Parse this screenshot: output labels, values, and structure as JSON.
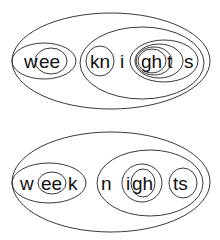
{
  "diagrams": [
    {
      "word": "weeknights",
      "segments": [
        {
          "text": "w",
          "x": 24,
          "y": 68
        },
        {
          "text": "ee",
          "x": 37,
          "y": 68
        },
        {
          "text": "kn",
          "x": 90,
          "y": 68
        },
        {
          "text": "i",
          "x": 119,
          "y": 68
        },
        {
          "text": "gh",
          "x": 142,
          "y": 68
        },
        {
          "text": "t",
          "x": 168,
          "y": 68
        },
        {
          "text": "s",
          "x": 183,
          "y": 68
        }
      ]
    },
    {
      "word": "week nights",
      "segments": [
        {
          "text": "w",
          "x": 20,
          "y": 190
        },
        {
          "text": "ee",
          "x": 39,
          "y": 190
        },
        {
          "text": "k",
          "x": 68,
          "y": 190
        },
        {
          "text": "n",
          "x": 101,
          "y": 190
        },
        {
          "text": "i",
          "x": 124,
          "y": 190
        },
        {
          "text": "gh",
          "x": 134,
          "y": 190
        },
        {
          "text": "ts",
          "x": 176,
          "y": 190
        }
      ]
    }
  ]
}
